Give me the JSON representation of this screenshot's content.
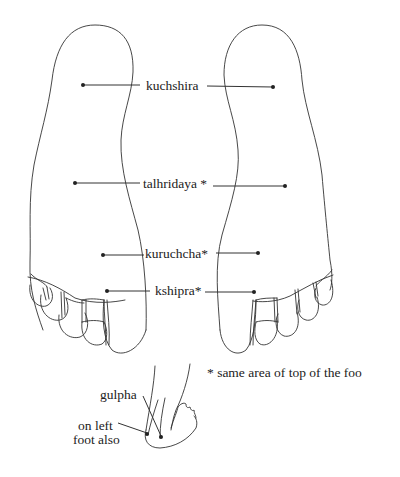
{
  "diagram": {
    "type": "reflexology-style foot sole marma point chart",
    "feet": [
      "left-sole",
      "right-sole"
    ],
    "colors": {
      "line": "#333333",
      "text": "#222222",
      "background": "#ffffff"
    }
  },
  "points": [
    {
      "id": "kuchshira",
      "label": "kuchshira",
      "asterisk": false
    },
    {
      "id": "talhridaya",
      "label": "talhridaya *",
      "asterisk": true
    },
    {
      "id": "kuruchcha",
      "label": "kuruchcha*",
      "asterisk": true
    },
    {
      "id": "kshipra",
      "label": "kshipra*",
      "asterisk": true
    }
  ],
  "note": {
    "text": "* same area of top of the foo"
  },
  "side_view": {
    "gulpha_label": "gulpha",
    "left_label_line1": "on left",
    "left_label_line2": "foot also"
  }
}
